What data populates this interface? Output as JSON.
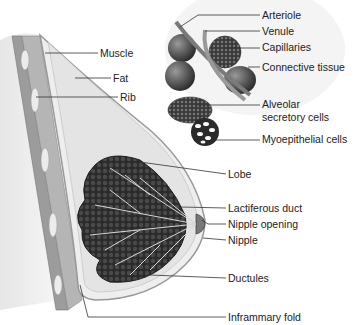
{
  "diagram": {
    "type": "anatomical-illustration",
    "colors": {
      "background": "#ffffff",
      "line": "#333333",
      "text": "#222222",
      "tissue_dark": "#2e2e2e",
      "tissue_mid": "#8a8a8a",
      "tissue_light": "#d9d9d9"
    },
    "labels": [
      {
        "id": "muscle",
        "text": "Muscle",
        "x": 100,
        "y": 48
      },
      {
        "id": "fat",
        "text": "Fat",
        "x": 113,
        "y": 73
      },
      {
        "id": "rib",
        "text": "Rib",
        "x": 120,
        "y": 92
      },
      {
        "id": "arteriole",
        "text": "Arteriole",
        "x": 262,
        "y": 10
      },
      {
        "id": "venule",
        "text": "Venule",
        "x": 262,
        "y": 26
      },
      {
        "id": "capillaries",
        "text": "Capillaries",
        "x": 262,
        "y": 42
      },
      {
        "id": "connective-tissue",
        "text": "Connective tissue",
        "x": 262,
        "y": 62
      },
      {
        "id": "alveolar-secretory-cells-1",
        "text": "Alveolar",
        "x": 262,
        "y": 99
      },
      {
        "id": "alveolar-secretory-cells-2",
        "text": "secretory cells",
        "x": 262,
        "y": 112
      },
      {
        "id": "myoepithelial-cells",
        "text": "Myoepithelial cells",
        "x": 262,
        "y": 134
      },
      {
        "id": "lobe",
        "text": "Lobe",
        "x": 228,
        "y": 169
      },
      {
        "id": "lactiferous-duct",
        "text": "Lactiferous duct",
        "x": 228,
        "y": 203
      },
      {
        "id": "nipple-opening",
        "text": "Nipple opening",
        "x": 228,
        "y": 219
      },
      {
        "id": "nipple",
        "text": "Nipple",
        "x": 228,
        "y": 235
      },
      {
        "id": "ductules",
        "text": "Ductules",
        "x": 228,
        "y": 273
      },
      {
        "id": "inframmary-fold",
        "text": "Inframmary fold",
        "x": 228,
        "y": 312
      }
    ]
  }
}
